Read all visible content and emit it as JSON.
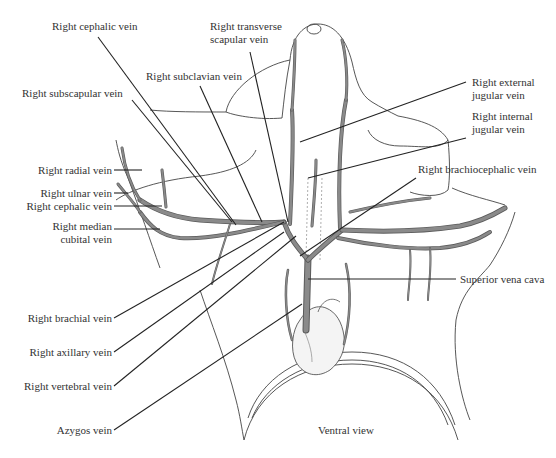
{
  "figure": {
    "view_label": "Ventral view",
    "left_labels": [
      {
        "id": "right-cephalic-vein-top",
        "text": "Right cephalic vein"
      },
      {
        "id": "right-subscapular-vein",
        "text": "Right subscapular vein"
      },
      {
        "id": "right-subclavian-vein",
        "text": "Right subclavian vein"
      },
      {
        "id": "right-radial-vein",
        "text": "Right radial vein"
      },
      {
        "id": "right-ulnar-vein",
        "text": "Right ulnar vein"
      },
      {
        "id": "right-cephalic-vein-arm",
        "text": "Right cephalic vein"
      },
      {
        "id": "right-median-cubital-vein",
        "line1": "Right median",
        "line2": "cubital vein"
      },
      {
        "id": "right-brachial-vein",
        "text": "Right brachial vein"
      },
      {
        "id": "right-axillary-vein",
        "text": "Right axillary vein"
      },
      {
        "id": "right-vertebral-vein",
        "text": "Right vertebral vein"
      },
      {
        "id": "azygos-vein",
        "text": "Azygos vein"
      }
    ],
    "right_labels": [
      {
        "id": "right-transverse-scapular-vein",
        "line1": "Right transverse",
        "line2": "scapular vein"
      },
      {
        "id": "right-external-jugular-vein",
        "line1": "Right external",
        "line2": "jugular vein"
      },
      {
        "id": "right-internal-jugular-vein",
        "line1": "Right internal",
        "line2": "jugular vein"
      },
      {
        "id": "right-brachiocephalic-vein",
        "text": "Right brachiocephalic vein"
      },
      {
        "id": "superior-vena-cava",
        "text": "Superior vena cava"
      }
    ]
  }
}
